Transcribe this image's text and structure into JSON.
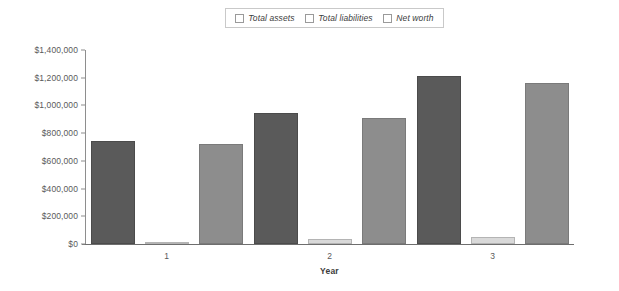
{
  "chart_data": {
    "type": "bar",
    "title": "",
    "subtitle": "",
    "xlabel": "Year",
    "ylabel": "",
    "categories": [
      "1",
      "2",
      "3"
    ],
    "series": [
      {
        "name": "Total assets",
        "color": "#5a5a5a",
        "values": [
          740000,
          945000,
          1210000
        ]
      },
      {
        "name": "Total liabilities",
        "color": "#d9d9d9",
        "values": [
          12000,
          33000,
          48000
        ]
      },
      {
        "name": "Net worth",
        "color": "#8d8d8d",
        "values": [
          722000,
          912000,
          1165000
        ]
      }
    ],
    "ylim": [
      0,
      1400000
    ],
    "ytick_labels": [
      "$1,400,000",
      "$1,200,000",
      "$1,000,000",
      "$800,000",
      "$600,000",
      "$400,000",
      "$200,000",
      "$0"
    ],
    "ytick_values": [
      1400000,
      1200000,
      1000000,
      800000,
      600000,
      400000,
      200000,
      0
    ],
    "grid": false,
    "legend_position": "top-center",
    "legend": [
      "Total assets",
      "Total liabilities",
      "Net worth"
    ]
  },
  "legend": {
    "items": [
      {
        "label": "Total assets",
        "swatch": "legend-swatch-total-assets"
      },
      {
        "label": "Total liabilities",
        "swatch": "legend-swatch-total-liabilities"
      },
      {
        "label": "Net worth",
        "swatch": "legend-swatch-net-worth"
      }
    ]
  },
  "axis": {
    "x_title": "Year"
  }
}
